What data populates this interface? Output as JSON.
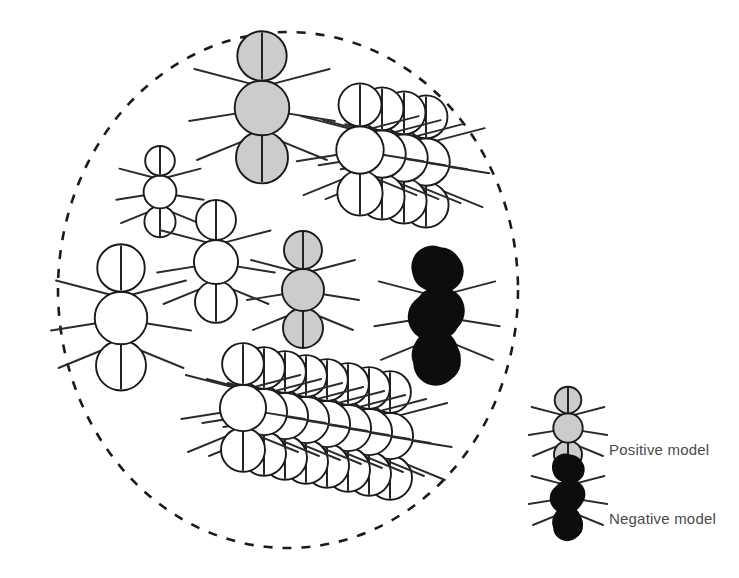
{
  "figure": {
    "type": "scientific-diagram",
    "background_color": "#ffffff",
    "arena": {
      "name": "dashed-circular-arena",
      "shape": "ellipse",
      "center_x": 288,
      "center_y": 290,
      "radius_x": 230,
      "radius_y": 258,
      "stroke_color": "#1a1a1a",
      "stroke_width": 2.6,
      "dash_pattern": "9 10",
      "fill": "none"
    }
  },
  "colors": {
    "positive_fill": "#cccccc",
    "negative_fill": "#0d0d0d",
    "neutral_fill": "#ffffff",
    "outline": "#1a1a1a",
    "leg_color": "#2b2b2b",
    "label_text": "#4a4a4a"
  },
  "ant_types": {
    "positive": {
      "key": "positive",
      "fill": "#cccccc",
      "label": "Positive model"
    },
    "negative": {
      "key": "negative",
      "fill": "#0d0d0d",
      "label": "Negative model"
    },
    "neutral": {
      "key": "neutral",
      "fill": "#ffffff",
      "label": ""
    }
  },
  "arena_ants": [
    {
      "id": "ant-positive-top",
      "type": "positive",
      "x": 262,
      "y": 108,
      "scale": 1.3,
      "count": 1,
      "cluster_step": 0
    },
    {
      "id": "ant-neutral-small-left",
      "type": "neutral",
      "x": 160,
      "y": 192,
      "scale": 0.78,
      "count": 1,
      "cluster_step": 0
    },
    {
      "id": "ant-neutral-mid",
      "type": "neutral",
      "x": 216,
      "y": 262,
      "scale": 1.05,
      "count": 1,
      "cluster_step": 0
    },
    {
      "id": "ant-neutral-large-left",
      "type": "neutral",
      "x": 121,
      "y": 318,
      "scale": 1.25,
      "count": 1,
      "cluster_step": 0
    },
    {
      "id": "ant-positive-mid",
      "type": "positive",
      "x": 303,
      "y": 290,
      "scale": 1.0,
      "count": 1,
      "cluster_step": 0
    },
    {
      "id": "ant-negative-right",
      "type": "negative",
      "x": 437,
      "y": 315,
      "scale": 1.12,
      "count": 1,
      "cluster_step": 0
    },
    {
      "id": "cluster-neutral-upper-right",
      "type": "neutral",
      "x": 360,
      "y": 150,
      "scale": 1.13,
      "count": 4,
      "cluster_step": 22
    },
    {
      "id": "cluster-neutral-bottom",
      "type": "neutral",
      "x": 243,
      "y": 408,
      "scale": 1.1,
      "count": 8,
      "cluster_step": 21
    }
  ],
  "legend": {
    "name": "model-legend",
    "position": "bottom-right",
    "items": [
      {
        "id": "legend-positive",
        "type": "positive",
        "label": "Positive model",
        "icon_x": 568,
        "icon_y": 428,
        "icon_scale": 0.7,
        "text_x": 609,
        "text_y": 455
      },
      {
        "id": "legend-negative",
        "type": "negative",
        "label": "Negative model",
        "icon_x": 568,
        "icon_y": 497,
        "icon_scale": 0.7,
        "text_x": 609,
        "text_y": 524
      }
    ]
  },
  "counts": {
    "positive_models": 2,
    "negative_models": 1,
    "neutral_models": 15,
    "total_ants": 18
  }
}
